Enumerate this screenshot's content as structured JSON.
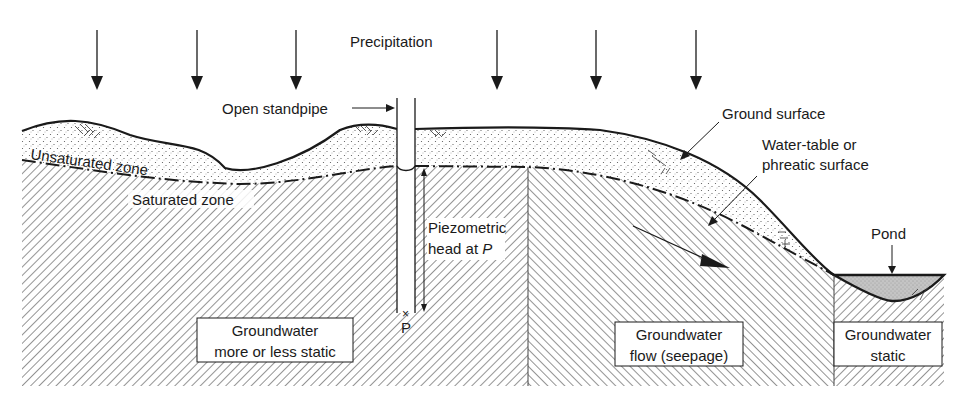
{
  "figure": {
    "colors": {
      "ink": "#1a1a1a",
      "pond_fill": "#bdbdbd",
      "background": "#ffffff"
    }
  },
  "labels": {
    "precipitation": "Precipitation",
    "open_standpipe": "Open standpipe",
    "ground_surface": "Ground surface",
    "water_table_line1": "Water-table or",
    "water_table_line2": "phreatic surface",
    "unsaturated_zone": "Unsaturated zone",
    "saturated_zone": "Saturated zone",
    "piezometric_line1": "Piezometric",
    "piezometric_line2_prefix": "head at ",
    "piezometric_line2_var": "P",
    "point_p": "P",
    "pond": "Pond"
  },
  "boxes": {
    "static_zone": {
      "line1": "Groundwater",
      "line2": "more or less static"
    },
    "seepage_zone": {
      "line1": "Groundwater",
      "line2": "flow (seepage)"
    },
    "pond_zone": {
      "line1": "Groundwater",
      "line2": "static"
    }
  },
  "precipitation_arrows": [
    {
      "x": 97
    },
    {
      "x": 197
    },
    {
      "x": 296
    },
    {
      "x": 497
    },
    {
      "x": 596
    },
    {
      "x": 696
    }
  ],
  "zones": [
    {
      "name": "Groundwater more or less static",
      "hatch": "forward-diagonal"
    },
    {
      "name": "Groundwater flow (seepage)",
      "hatch": "back-diagonal"
    },
    {
      "name": "Groundwater static",
      "hatch": "forward-diagonal"
    }
  ]
}
